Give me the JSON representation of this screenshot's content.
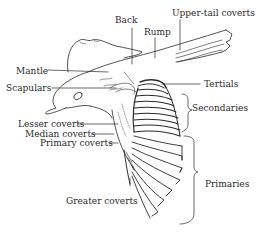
{
  "diagram": {
    "labels": {
      "back": "Back",
      "rump": "Rump",
      "upper_tail_coverts": "Upper-tail coverts",
      "mantle": "Mantle",
      "scapulars": "Scapulars",
      "tertials": "Tertials",
      "secondaries": "Secondaries",
      "lesser_coverts": "Lesser coverts",
      "median_coverts": "Median coverts",
      "primary_coverts": "Primary coverts",
      "primaries": "Primaries",
      "greater_coverts": "Greater coverts"
    },
    "colors": {
      "ink": "#2a2a2a",
      "background": "#ffffff"
    }
  }
}
